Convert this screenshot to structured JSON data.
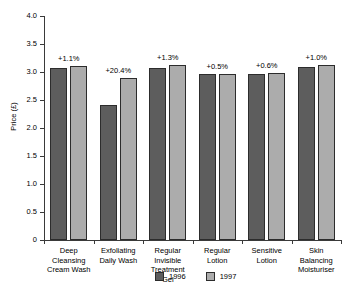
{
  "chart_data": {
    "type": "bar",
    "title": "",
    "xlabel": "",
    "ylabel": "Price (£)",
    "ylim": [
      0,
      4.0
    ],
    "ytick_labels": [
      "4.0",
      "3.5",
      "3.0",
      "2.5",
      "2.0",
      "1.5",
      "1.0",
      "0.5",
      "0"
    ],
    "ytick_values": [
      4.0,
      3.5,
      3.0,
      2.5,
      2.0,
      1.5,
      1.0,
      0.5,
      0
    ],
    "grid": false,
    "legend_position": "bottom",
    "categories": [
      "Deep Cleansing Cream Wash",
      "Exfoliating Daily Wash",
      "Regular Invisible Treatment Gel",
      "Regular Lotion",
      "Sensitive Lotion",
      "Skin Balancing Moisturiser"
    ],
    "category_lines": [
      [
        "Deep",
        "Cleansing",
        "Cream Wash"
      ],
      [
        "Exfoliating",
        "Daily Wash"
      ],
      [
        "Regular",
        "Invisible",
        "Treatment",
        "Gel"
      ],
      [
        "Regular",
        "Lotion"
      ],
      [
        "Sensitive",
        "Lotion"
      ],
      [
        "Skin",
        "Balancing",
        "Moisturiser"
      ]
    ],
    "series": [
      {
        "name": "1996",
        "color": "#5d5d5d",
        "values": [
          3.08,
          2.41,
          3.08,
          2.96,
          2.97,
          3.09
        ]
      },
      {
        "name": "1997",
        "color": "#acacac",
        "values": [
          3.11,
          2.9,
          3.12,
          2.97,
          2.99,
          3.12
        ]
      }
    ],
    "annotations": [
      "+1.1%",
      "+20.4%",
      "+1.3%",
      "+0.5%",
      "+0.6%",
      "+1.0%"
    ]
  },
  "legend": {
    "items": [
      {
        "label": "1996",
        "color": "#5d5d5d"
      },
      {
        "label": "1997",
        "color": "#acacac"
      }
    ]
  }
}
